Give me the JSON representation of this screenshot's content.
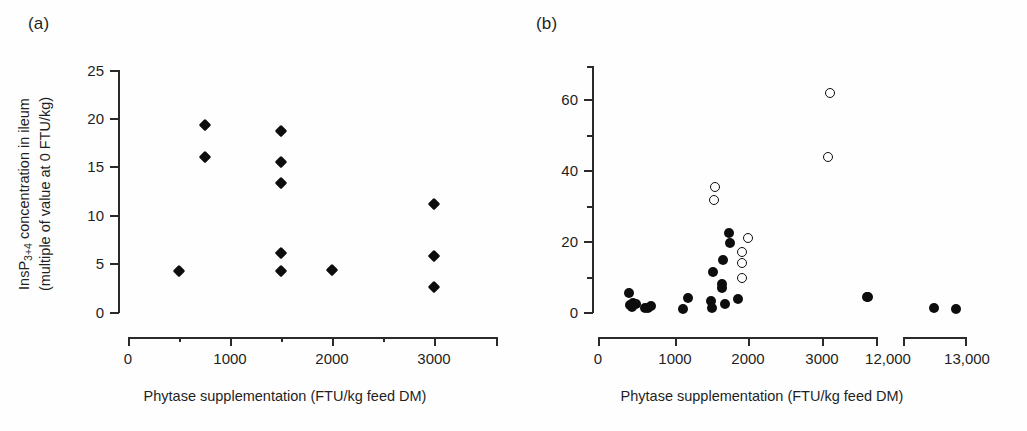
{
  "figure": {
    "background": "#ffffff",
    "marker_color": "#0d0d0d",
    "axis_color": "#2a2a2a"
  },
  "panel_a": {
    "label": "(a)",
    "y_axis": {
      "title_line1": "InsP",
      "title_sub": "3+4",
      "title_line1_rest": " concentration in ileum",
      "title_line2": "(multiple of value at 0 FTU/kg)",
      "ticks": [
        "0",
        "5",
        "10",
        "15",
        "20",
        "25"
      ],
      "min": 0,
      "max": 25
    },
    "x_axis": {
      "title": "Phytase supplementation (FTU/kg feed DM)",
      "ticks": [
        "0",
        "1000",
        "2000",
        "3000"
      ],
      "minor_ticks": [
        "500",
        "1500",
        "2500"
      ],
      "min": 0,
      "max": 3000
    }
  },
  "panel_b": {
    "label": "(b)",
    "y_axis": {
      "ticks": [
        "0",
        "20",
        "40",
        "60"
      ],
      "minor_ticks": [
        "10",
        "30",
        "50",
        "70"
      ],
      "min": 0,
      "max": 70
    },
    "x_axis": {
      "title": "Phytase supplementation (FTU/kg feed DM)",
      "ticks_left": [
        "0",
        "1000",
        "2000",
        "3000",
        "12,000"
      ],
      "ticks_right": [
        "13,000"
      ],
      "axis_break": true,
      "min": 0,
      "max": 13000
    }
  },
  "chart_data": [
    {
      "type": "scatter",
      "title": "(a)",
      "xlabel": "Phytase supplementation (FTU/kg feed DM)",
      "ylabel": "InsP3+4 concentration in ileum (multiple of value at 0 FTU/kg)",
      "xlim": [
        0,
        3000
      ],
      "ylim": [
        0,
        25
      ],
      "xticks": [
        0,
        1000,
        2000,
        3000
      ],
      "xminorticks": [
        500,
        1500,
        2500
      ],
      "yticks": [
        0,
        5,
        10,
        15,
        20,
        25
      ],
      "grid": false,
      "legend": false,
      "series": [
        {
          "name": "InsP3+4 ileum (filled diamond)",
          "marker": "filled-diamond",
          "points": [
            {
              "x": 500,
              "y": 4.2
            },
            {
              "x": 750,
              "y": 19.3
            },
            {
              "x": 750,
              "y": 16.0
            },
            {
              "x": 1500,
              "y": 18.7
            },
            {
              "x": 1500,
              "y": 15.5
            },
            {
              "x": 1500,
              "y": 13.3
            },
            {
              "x": 1500,
              "y": 6.1
            },
            {
              "x": 1500,
              "y": 4.2
            },
            {
              "x": 2000,
              "y": 4.3
            },
            {
              "x": 3000,
              "y": 11.2
            },
            {
              "x": 3000,
              "y": 5.8
            },
            {
              "x": 3000,
              "y": 2.6
            }
          ]
        }
      ]
    },
    {
      "type": "scatter",
      "title": "(b)",
      "xlabel": "Phytase supplementation (FTU/kg feed DM)",
      "ylabel": "",
      "xlim": [
        0,
        13000
      ],
      "ylim": [
        0,
        70
      ],
      "xticks": [
        0,
        1000,
        2000,
        3000,
        12000,
        13000
      ],
      "yticks": [
        0,
        20,
        40,
        60
      ],
      "yminorticks": [
        10,
        30,
        50,
        70
      ],
      "axis_break": {
        "from": 3400,
        "to": 11600
      },
      "grid": false,
      "legend": false,
      "series": [
        {
          "name": "filled circles",
          "marker": "filled-circle",
          "points": [
            {
              "x": 420,
              "y": 5.5
            },
            {
              "x": 430,
              "y": 2.0
            },
            {
              "x": 460,
              "y": 1.3
            },
            {
              "x": 470,
              "y": 2.6
            },
            {
              "x": 520,
              "y": 2.4
            },
            {
              "x": 640,
              "y": 1.0
            },
            {
              "x": 680,
              "y": 1.1
            },
            {
              "x": 720,
              "y": 1.8
            },
            {
              "x": 1150,
              "y": 0.9
            },
            {
              "x": 1220,
              "y": 4.0
            },
            {
              "x": 1530,
              "y": 3.0
            },
            {
              "x": 1550,
              "y": 1.2
            },
            {
              "x": 1560,
              "y": 11.3
            },
            {
              "x": 1680,
              "y": 8.0
            },
            {
              "x": 1690,
              "y": 6.8
            },
            {
              "x": 1700,
              "y": 14.8
            },
            {
              "x": 1730,
              "y": 2.3
            },
            {
              "x": 1780,
              "y": 22.5
            },
            {
              "x": 1790,
              "y": 19.7
            },
            {
              "x": 1900,
              "y": 3.6
            },
            {
              "x": 11700,
              "y": 4.2
            },
            {
              "x": 11760,
              "y": 4.4
            },
            {
              "x": 12500,
              "y": 1.2
            },
            {
              "x": 12850,
              "y": 0.9
            }
          ]
        },
        {
          "name": "open circles",
          "marker": "open-circle",
          "points": [
            {
              "x": 1590,
              "y": 35.5
            },
            {
              "x": 1580,
              "y": 31.8
            },
            {
              "x": 1950,
              "y": 17.0
            },
            {
              "x": 1960,
              "y": 14.0
            },
            {
              "x": 1960,
              "y": 9.8
            },
            {
              "x": 2040,
              "y": 21.0
            },
            {
              "x": 3150,
              "y": 62.3
            },
            {
              "x": 3120,
              "y": 44.0
            }
          ]
        }
      ]
    }
  ]
}
